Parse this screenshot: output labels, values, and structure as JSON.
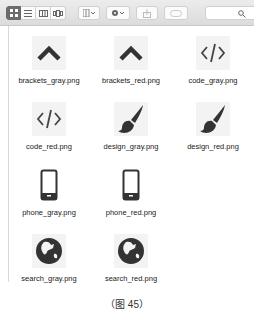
{
  "toolbar": {
    "view_modes": [
      "icon-view",
      "list-view",
      "column-view",
      "cover-flow-view"
    ],
    "active_view": "icon-view",
    "arrange_label": "arrange",
    "action_label": "action",
    "search": {
      "placeholder": ""
    }
  },
  "files": [
    {
      "name": "brackets_gray.png",
      "icon": "chevron-up-icon"
    },
    {
      "name": "brackets_red.png",
      "icon": "chevron-up-icon"
    },
    {
      "name": "code_gray.png",
      "icon": "code-icon"
    },
    {
      "name": "code_red.png",
      "icon": "code-icon"
    },
    {
      "name": "design_gray.png",
      "icon": "paintbrush-icon"
    },
    {
      "name": "design_red.png",
      "icon": "paintbrush-icon"
    },
    {
      "name": "phone_gray.png",
      "icon": "phone-icon"
    },
    {
      "name": "phone_red.png",
      "icon": "phone-icon"
    },
    {
      "name": "search_gray.png",
      "icon": "globe-icon"
    },
    {
      "name": "search_red.png",
      "icon": "globe-icon"
    }
  ],
  "caption": "（图 45）"
}
